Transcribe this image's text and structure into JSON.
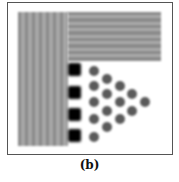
{
  "figure": {
    "caption": "(b)",
    "colors": {
      "frame": "#555555",
      "stripe_dark": "#8a8a8a",
      "stripe_light": "#a8a8a8",
      "square": "#000000",
      "dot": "#5a5a5a",
      "background": "#ffffff"
    },
    "vertical_stripes": {
      "count": 7
    },
    "horizontal_stripes": {
      "count": 8
    },
    "squares": {
      "count": 4
    },
    "dots": {
      "columns": [
        5,
        4,
        3,
        2,
        1
      ],
      "total": 15
    }
  }
}
